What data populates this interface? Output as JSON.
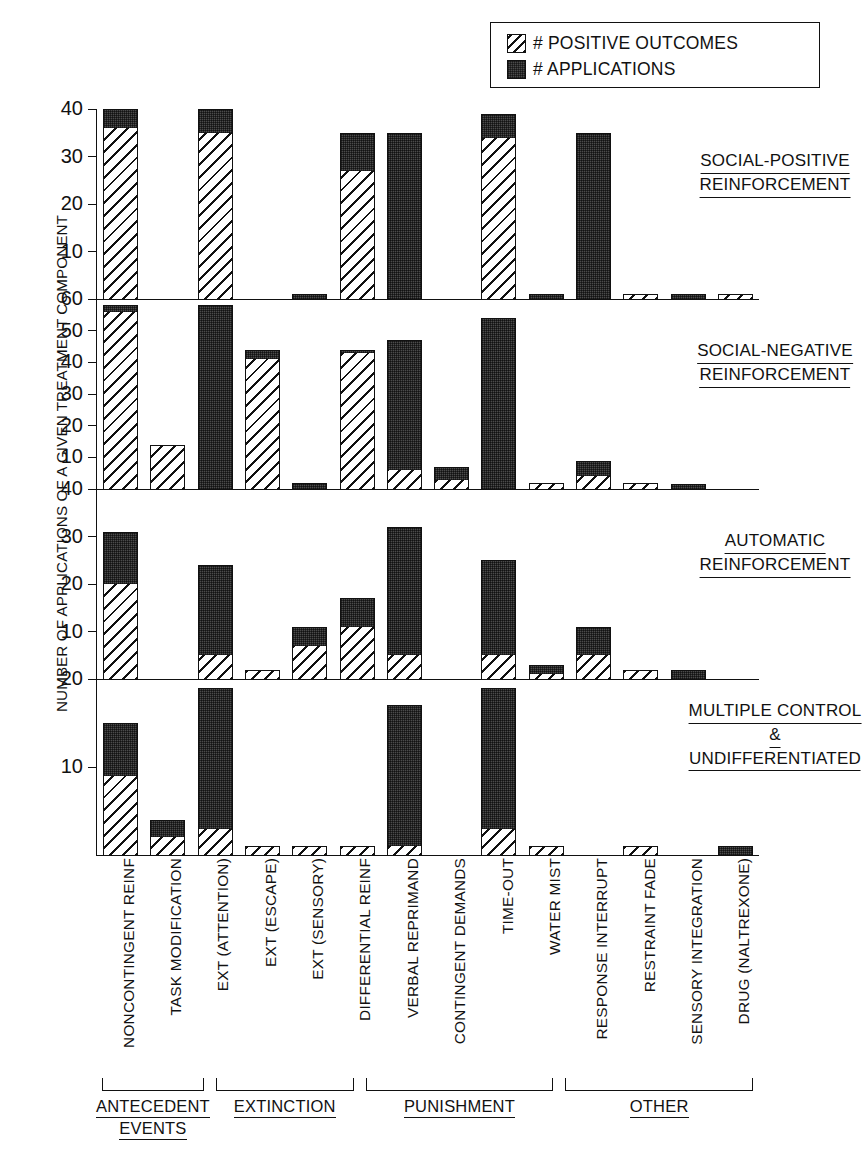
{
  "legend": {
    "items": [
      {
        "key": "positive_outcomes",
        "label": "# POSITIVE OUTCOMES",
        "pattern": "hatch"
      },
      {
        "key": "applications",
        "label": "# APPLICATIONS",
        "pattern": "dark"
      }
    ]
  },
  "axis": {
    "ylabel": "NUMBER OF APPLICATIONS OF A GIVEN TREATMENT COMPONENT"
  },
  "groups": [
    {
      "name": "ANTECEDENT\nEVENTS",
      "line1": "ANTECEDENT",
      "line2": "EVENTS",
      "count": 2
    },
    {
      "name": "EXTINCTION",
      "line1": "EXTINCTION",
      "line2": "",
      "count": 3
    },
    {
      "name": "PUNISHMENT",
      "line1": "PUNISHMENT",
      "line2": "",
      "count": 4
    },
    {
      "name": "OTHER",
      "line1": "OTHER",
      "line2": "",
      "count": 4
    }
  ],
  "chart_data": {
    "type": "bar",
    "title": "",
    "xlabel": "",
    "ylabel": "NUMBER OF APPLICATIONS OF A GIVEN TREATMENT COMPONENT",
    "stacked": true,
    "grid": false,
    "legend_position": "top-right",
    "categories": [
      "NONCONTINGENT REINF",
      "TASK MODIFICATION",
      "EXT (ATTENTION)",
      "EXT (ESCAPE)",
      "EXT (SENSORY)",
      "DIFFERENTIAL REINF",
      "VERBAL REPRIMAND",
      "CONTINGENT DEMANDS",
      "TIME-OUT",
      "WATER MIST",
      "RESPONSE INTERRUPT",
      "RESTRAINT FADE",
      "SENSORY INTEGRATION",
      "DRUG (NALTREXONE)"
    ],
    "panels": [
      {
        "label_lines": [
          "SOCIAL-POSITIVE",
          "REINFORCEMENT"
        ],
        "ylim": [
          0,
          40
        ],
        "yticks": [
          10,
          20,
          30,
          40
        ],
        "series": [
          {
            "name": "# APPLICATIONS",
            "values": [
              40,
              0,
              40,
              0,
              1,
              35,
              35,
              0,
              39,
              1,
              35,
              1,
              1,
              1
            ]
          },
          {
            "name": "# POSITIVE OUTCOMES",
            "values": [
              36,
              0,
              35,
              0,
              0,
              27,
              0,
              0,
              34,
              0,
              0,
              1,
              0,
              1
            ]
          }
        ]
      },
      {
        "label_lines": [
          "SOCIAL-NEGATIVE",
          "REINFORCEMENT"
        ],
        "ylim": [
          0,
          60
        ],
        "yticks": [
          10,
          20,
          30,
          40,
          50,
          60
        ],
        "series": [
          {
            "name": "# APPLICATIONS",
            "values": [
              58,
              14,
              58,
              44,
              2,
              44,
              47,
              7,
              54,
              2,
              9,
              2,
              1,
              0
            ]
          },
          {
            "name": "# POSITIVE OUTCOMES",
            "values": [
              56,
              14,
              0,
              41,
              0,
              43,
              6,
              3,
              0,
              1,
              4,
              2,
              0,
              0
            ]
          }
        ]
      },
      {
        "label_lines": [
          "AUTOMATIC",
          "REINFORCEMENT"
        ],
        "ylim": [
          0,
          40
        ],
        "yticks": [
          10,
          20,
          30,
          40
        ],
        "series": [
          {
            "name": "# APPLICATIONS",
            "values": [
              31,
              0,
              24,
              2,
              11,
              17,
              32,
              0,
              25,
              3,
              11,
              2,
              2,
              0
            ]
          },
          {
            "name": "# POSITIVE OUTCOMES",
            "values": [
              20,
              0,
              5,
              2,
              7,
              11,
              5,
              0,
              5,
              1,
              5,
              2,
              0,
              0
            ]
          }
        ]
      },
      {
        "label_lines": [
          "MULTIPLE CONTROL",
          "&",
          "UNDIFFERENTIATED"
        ],
        "ylim": [
          0,
          20
        ],
        "yticks": [
          10,
          20
        ],
        "series": [
          {
            "name": "# APPLICATIONS",
            "values": [
              15,
              4,
              19,
              1,
              1,
              1,
              17,
              0,
              19,
              1,
              0,
              1,
              0,
              1
            ]
          },
          {
            "name": "# POSITIVE OUTCOMES",
            "values": [
              9,
              2,
              3,
              1,
              1,
              1,
              1,
              0,
              3,
              1,
              0,
              1,
              0,
              0
            ]
          }
        ]
      }
    ]
  }
}
